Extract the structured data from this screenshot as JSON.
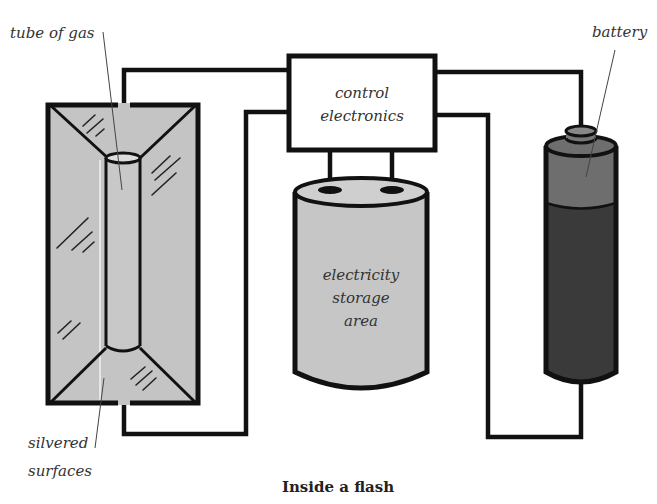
{
  "diagram": {
    "caption": "Inside a flash",
    "labels": {
      "tube_of_gas": "tube of gas",
      "battery": "battery",
      "control_electronics": [
        "control",
        "electronics"
      ],
      "storage": [
        "electricity",
        "storage",
        "area"
      ],
      "silvered_surfaces": [
        "silvered",
        "surfaces"
      ]
    },
    "components": [
      {
        "id": "reflector",
        "name": "silvered reflector housing",
        "color": "#c4c4c4"
      },
      {
        "id": "tube",
        "name": "tube of gas",
        "color": "#c8c8c8"
      },
      {
        "id": "control",
        "name": "control electronics",
        "color": "#ffffff"
      },
      {
        "id": "capacitor",
        "name": "electricity storage area",
        "color": "#c6c6c6"
      },
      {
        "id": "battery",
        "name": "battery",
        "top_color": "#6e6e6e",
        "body_color": "#3a3a3a"
      }
    ],
    "colors": {
      "line": "#111111",
      "background": "#ffffff",
      "text": "#333333"
    }
  }
}
